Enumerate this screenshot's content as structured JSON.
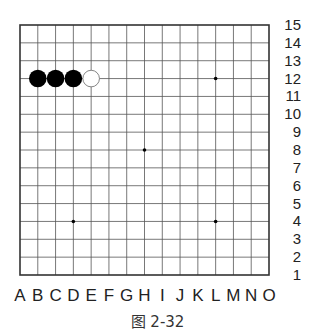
{
  "diagram": {
    "type": "go-board",
    "size": 15,
    "columns": [
      "A",
      "B",
      "C",
      "D",
      "E",
      "F",
      "G",
      "H",
      "I",
      "J",
      "K",
      "L",
      "M",
      "N",
      "O"
    ],
    "rows": [
      "15",
      "14",
      "13",
      "12",
      "11",
      "10",
      "9",
      "8",
      "7",
      "6",
      "5",
      "4",
      "3",
      "2",
      "1"
    ],
    "stones": [
      {
        "color": "black",
        "point": "B12"
      },
      {
        "color": "black",
        "point": "C12"
      },
      {
        "color": "black",
        "point": "D12"
      },
      {
        "color": "white",
        "point": "E12"
      }
    ],
    "star_points": [
      "D4",
      "H8",
      "L12",
      "L4"
    ],
    "colors": {
      "grid": "#555555",
      "border": "#333333",
      "black_stone": "#000000",
      "white_stone": "#ffffff",
      "white_stone_outline": "#777777"
    }
  },
  "caption": "图 2-32"
}
